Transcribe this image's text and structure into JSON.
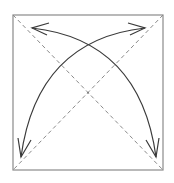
{
  "diagram": {
    "colors": {
      "background": "#ffffff",
      "box_stroke": "#8a8a8a",
      "diagonal_stroke": "#8a8a8a",
      "arrow_stroke": "#3a3a3a"
    },
    "box": {
      "x": 13,
      "y": 15,
      "width": 150,
      "height": 155
    },
    "diagonals": [
      {
        "from": [
          13,
          15
        ],
        "to": [
          163,
          170
        ],
        "style": "dashed"
      },
      {
        "from": [
          163,
          15
        ],
        "to": [
          13,
          170
        ],
        "style": "dashed"
      }
    ],
    "arrows": [
      {
        "name": "arc-bottom-left-to-top-right",
        "from": [
          21,
          157
        ],
        "to": [
          145,
          28
        ],
        "heads": [
          "start",
          "end"
        ]
      },
      {
        "name": "arc-top-left-to-bottom-right",
        "from": [
          32,
          28
        ],
        "to": [
          156,
          157
        ],
        "heads": [
          "start",
          "end"
        ]
      }
    ]
  }
}
